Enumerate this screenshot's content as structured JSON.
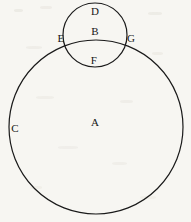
{
  "figure": {
    "type": "venn-style-circle-diagram",
    "background_color": "#f7f6f2",
    "stroke_color": "#1a1a1a",
    "label_color": "#161616",
    "width": 191,
    "height": 222,
    "shapes": [
      {
        "id": "large-circle",
        "name": "large-circle",
        "cx": 96,
        "cy": 127,
        "r": 87,
        "stroke_width": 1.2
      },
      {
        "id": "small-circle",
        "name": "small-circle",
        "cx": 95,
        "cy": 35,
        "r": 32,
        "stroke_width": 1.2
      }
    ],
    "labels": [
      {
        "id": "label-d",
        "text": "D",
        "x": 95,
        "y": 11,
        "describes": "top region of small circle, outside large circle"
      },
      {
        "id": "label-b",
        "text": "B",
        "x": 95,
        "y": 31,
        "describes": "small circle interior above intersection chord"
      },
      {
        "id": "label-e",
        "text": "E",
        "x": 61,
        "y": 38,
        "describes": "left intersection point of the two circles"
      },
      {
        "id": "label-g",
        "text": "G",
        "x": 131,
        "y": 38,
        "describes": "right intersection point of the two circles"
      },
      {
        "id": "label-f",
        "text": "F",
        "x": 94,
        "y": 60,
        "describes": "lens-shaped overlap region of both circles"
      },
      {
        "id": "label-a",
        "text": "A",
        "x": 95,
        "y": 122,
        "describes": "interior of large circle"
      },
      {
        "id": "label-c",
        "text": "C",
        "x": 15,
        "y": 128,
        "describes": "left edge of large circle"
      }
    ]
  }
}
